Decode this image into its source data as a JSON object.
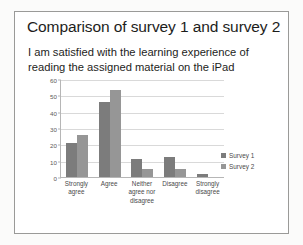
{
  "slide": {
    "title": "Comparison of survey 1 and survey 2",
    "subtitle": "I am satisfied with the learning experience of reading the assigned material on the iPad"
  },
  "chart_data": {
    "type": "bar",
    "title": "I am satisfied with the learning experience of reading the assigned material on the iPad",
    "categories": [
      "Strongly agree",
      "Agree",
      "Neither agree nor disagree",
      "Disagree",
      "Strongly disagree"
    ],
    "series": [
      {
        "name": "Survey 1",
        "color": "#7c7c7c",
        "values": [
          21,
          46,
          11,
          12,
          2
        ]
      },
      {
        "name": "Survey 2",
        "color": "#969696",
        "values": [
          26,
          53,
          5,
          5,
          0
        ]
      }
    ],
    "xlabel": "",
    "ylabel": "",
    "ylim": [
      0,
      60
    ],
    "yticks": [
      0,
      10,
      20,
      30,
      40,
      50,
      60
    ],
    "grid": true,
    "legend_position": "right"
  }
}
